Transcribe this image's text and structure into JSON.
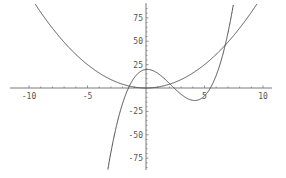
{
  "chart_data": {
    "type": "line",
    "title": "",
    "xlabel": "",
    "ylabel": "",
    "xlim": [
      -10.5,
      10.5
    ],
    "ylim": [
      -85,
      90
    ],
    "grid": false,
    "legend": null,
    "x_ticks": [
      -10,
      -5,
      5,
      10
    ],
    "y_ticks": [
      75,
      50,
      25,
      -25,
      -50,
      -75
    ],
    "x_tick_labels": [
      "-10",
      "-5",
      "5",
      "10"
    ],
    "y_tick_labels": [
      "75",
      "50",
      "25",
      "-25",
      "-50",
      "-75"
    ],
    "series": [
      {
        "name": "parabola",
        "expression": "x^2",
        "x": [
          -9,
          -8,
          -6,
          -4,
          -2,
          0,
          2,
          4,
          6,
          7,
          8,
          9
        ],
        "y": [
          81,
          64,
          36,
          16,
          4,
          0,
          4,
          16,
          36,
          49,
          64,
          81
        ]
      },
      {
        "name": "cubic",
        "expression": "(x+1.5)(x-2.4)(x-5.5)",
        "x": [
          -3.3,
          -3,
          -2,
          -1.5,
          -1,
          0,
          0.6,
          1,
          2,
          2.4,
          3,
          4,
          4.3,
          5,
          5.5,
          6,
          6.9,
          7.4
        ],
        "y": [
          -90,
          -69,
          -22,
          0,
          9,
          20,
          20,
          18,
          6,
          0,
          -8,
          -15,
          -15,
          -10,
          0,
          13,
          53,
          84
        ]
      }
    ],
    "colors": {
      "axis": "#7a7a7a",
      "curve": "#3a3a3a",
      "label": "#555555"
    }
  }
}
